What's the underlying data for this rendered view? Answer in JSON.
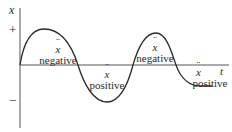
{
  "diagram": {
    "axes": {
      "y_label": "x",
      "x_label": "t",
      "plus_mark": "+",
      "minus_mark": "−"
    },
    "regions": [
      {
        "symbol": "x",
        "accent": "double-dot",
        "label": "negative"
      },
      {
        "symbol": "x",
        "accent": "double-dot",
        "label": "positive"
      },
      {
        "symbol": "x",
        "accent": "double-dot",
        "label": "negative"
      },
      {
        "symbol": "x",
        "accent": "double-dot",
        "label": "positive"
      }
    ],
    "curve": {
      "description": "damped oscillation of displacement x over time t",
      "color": "#2a2a2a"
    }
  }
}
